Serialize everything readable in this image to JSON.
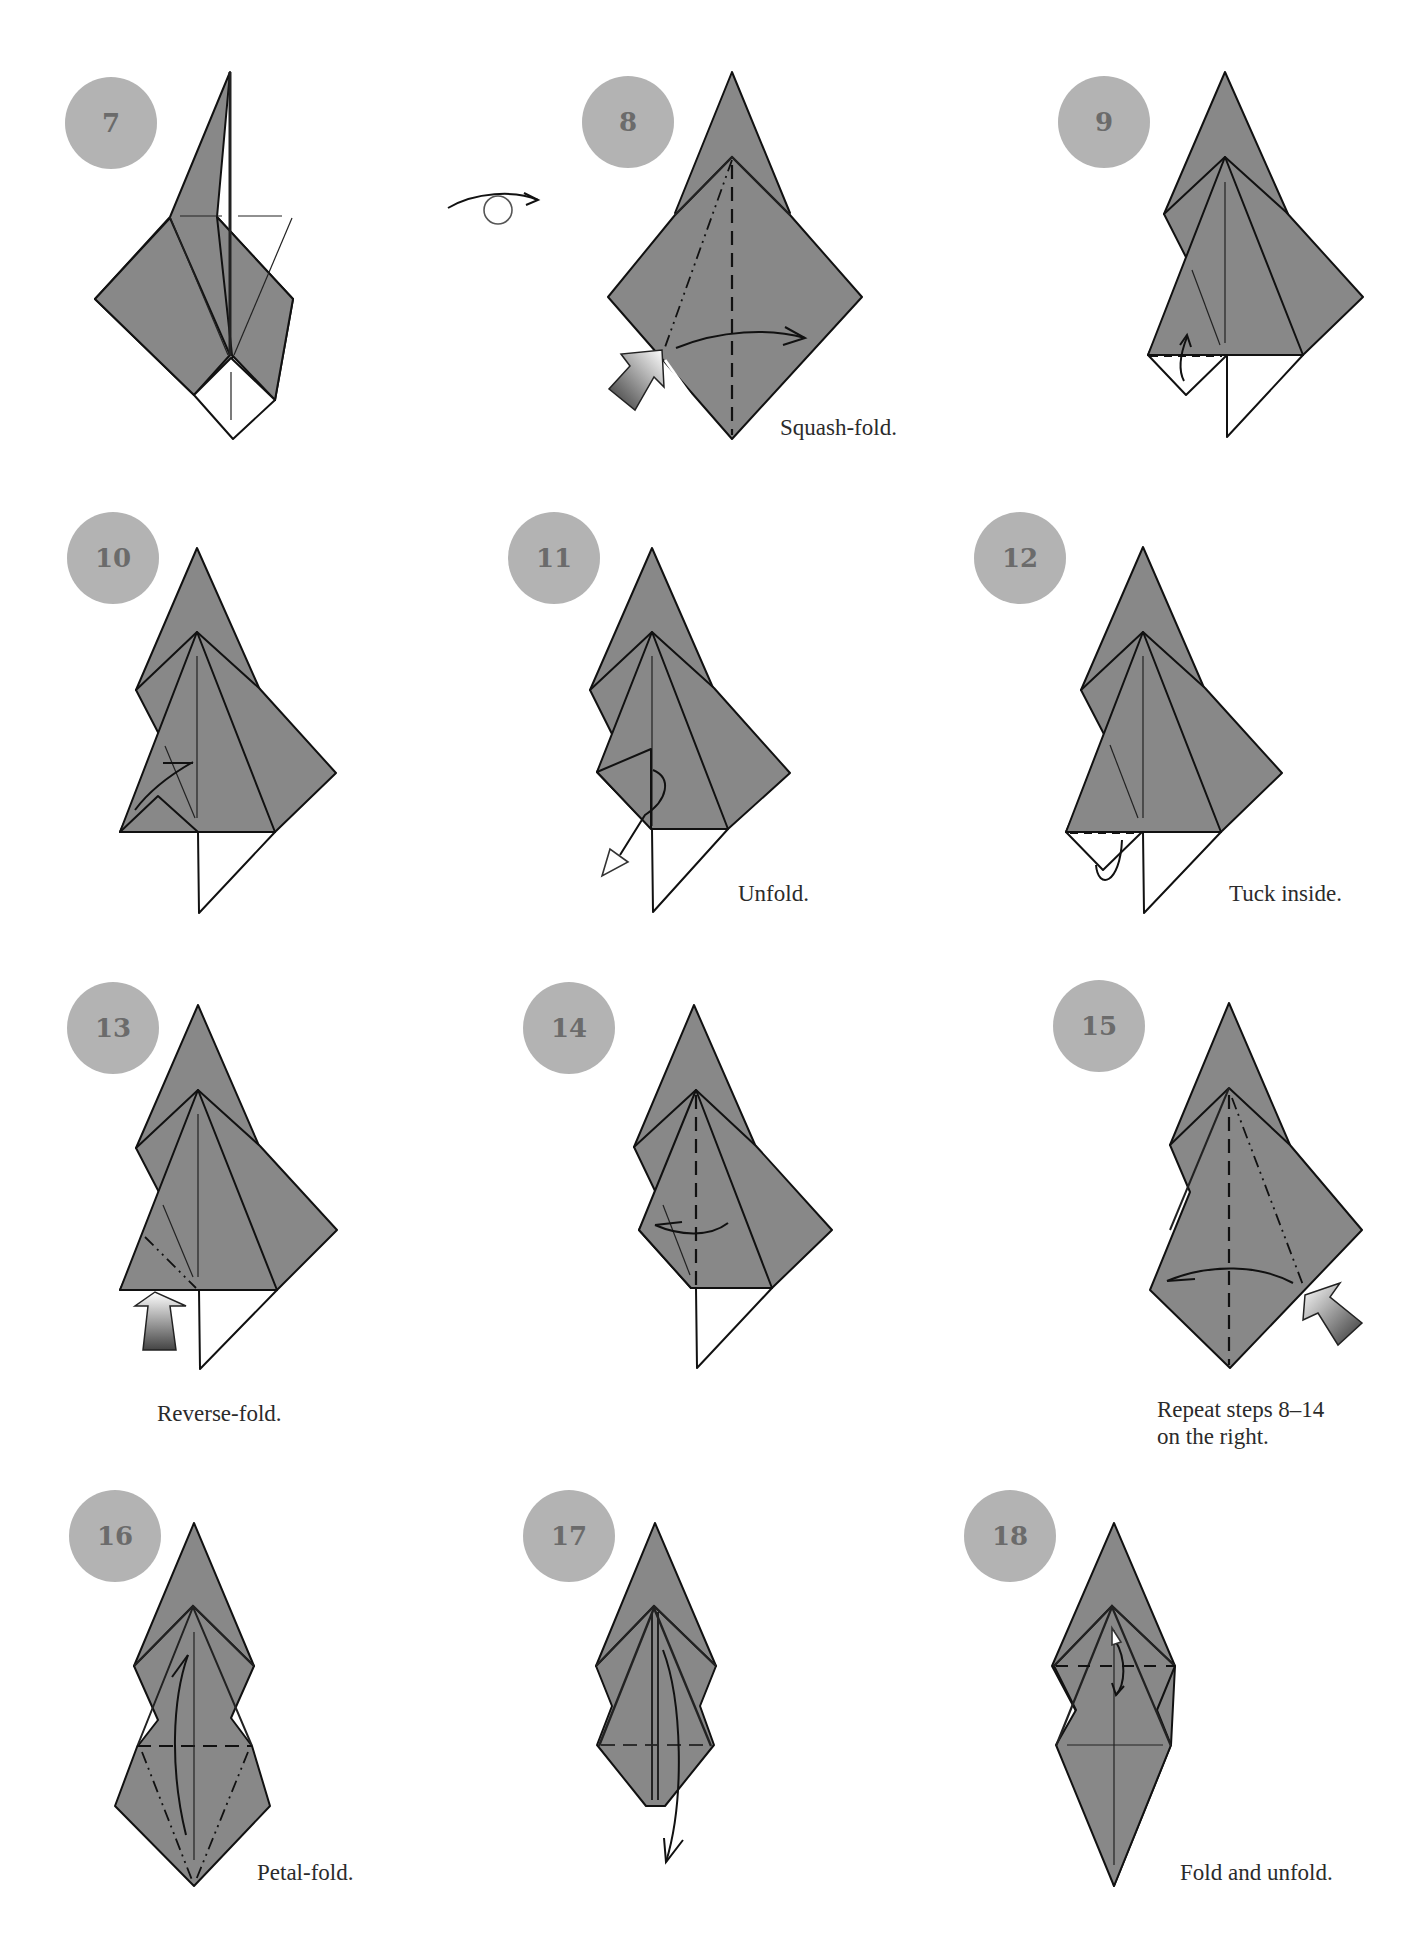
{
  "page": {
    "background": "#ffffff",
    "paper_color": "#888888",
    "badge_color": "#b3b3b3",
    "badge_text_color": "#6b6b6b"
  },
  "turn_over_symbol": "turn-over-icon",
  "steps": [
    {
      "number": "7",
      "caption": ""
    },
    {
      "number": "8",
      "caption": "Squash-fold."
    },
    {
      "number": "9",
      "caption": ""
    },
    {
      "number": "10",
      "caption": ""
    },
    {
      "number": "11",
      "caption": "Unfold."
    },
    {
      "number": "12",
      "caption": "Tuck inside."
    },
    {
      "number": "13",
      "caption": "Reverse-fold."
    },
    {
      "number": "14",
      "caption": ""
    },
    {
      "number": "15",
      "caption_line1": "Repeat steps 8–14",
      "caption_line2": "on the right."
    },
    {
      "number": "16",
      "caption": "Petal-fold."
    },
    {
      "number": "17",
      "caption": ""
    },
    {
      "number": "18",
      "caption": "Fold and unfold."
    }
  ]
}
